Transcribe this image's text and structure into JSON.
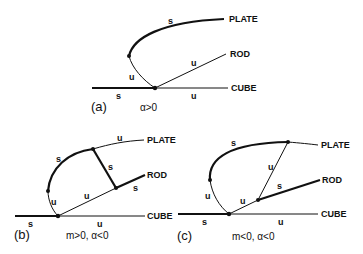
{
  "figure": {
    "panels": [
      {
        "id": "a",
        "label": "(a)",
        "condition": "α>0",
        "branches": {
          "plate": "PLATE",
          "rod": "ROD",
          "cube": "CUBE"
        },
        "stability": {
          "plate_upper": "s",
          "plate_lower": "u",
          "rod": "u",
          "cube_left": "s",
          "cube_right": "u"
        }
      },
      {
        "id": "b",
        "label": "(b)",
        "condition": "m>0, α<0",
        "branches": {
          "plate": "PLATE",
          "rod": "ROD",
          "cube": "CUBE"
        },
        "stability": {
          "plate_right": "u",
          "plate_upper": "s",
          "plate_lower": "u",
          "connector": "s",
          "rod_lower": "u",
          "rod_upper": "s",
          "cube_left": "s",
          "cube_right": "u"
        }
      },
      {
        "id": "c",
        "label": "(c)",
        "condition": "m<0, α<0",
        "branches": {
          "plate": "PLATE",
          "rod": "ROD",
          "cube": "CUBE"
        },
        "stability": {
          "plate_upper": "s",
          "plate_lower": "u",
          "connector": "u",
          "rod_lower": "u",
          "rod_upper": "s",
          "cube_left": "s",
          "cube_right": "u"
        }
      }
    ]
  }
}
